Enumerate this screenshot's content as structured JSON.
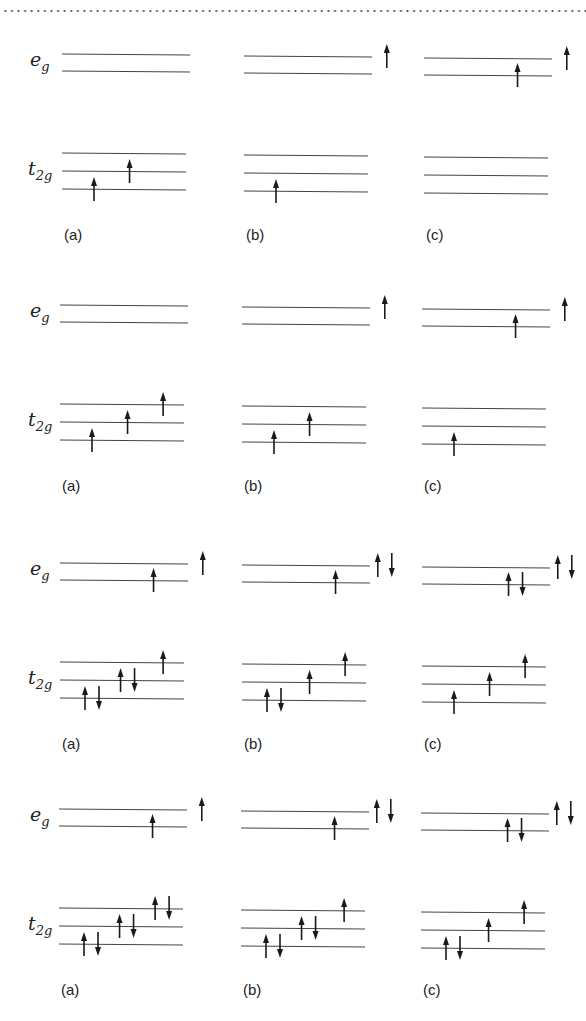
{
  "figure": {
    "row_labels": {
      "eg": "e",
      "eg_sub": "g",
      "t2g": "t",
      "t2g_sub": "2g"
    },
    "groups": [
      {
        "top": 54,
        "columns": [
          {
            "label": "(a)",
            "eg": [
              [],
              []
            ],
            "t2g": [
              [
                "up"
              ],
              [
                "up"
              ],
              []
            ]
          },
          {
            "label": "(b)",
            "eg": [
              [
                "up"
              ],
              []
            ],
            "t2g": [
              [
                "up"
              ],
              [],
              []
            ]
          },
          {
            "label": "(c)",
            "eg": [
              [
                "up"
              ],
              [
                "up"
              ]
            ],
            "t2g": [
              [],
              [],
              []
            ]
          }
        ]
      },
      {
        "top": 305,
        "columns": [
          {
            "label": "(a)",
            "eg": [
              [],
              []
            ],
            "t2g": [
              [
                "up"
              ],
              [
                "up"
              ],
              [
                "up"
              ]
            ]
          },
          {
            "label": "(b)",
            "eg": [
              [
                "up"
              ],
              []
            ],
            "t2g": [
              [
                "up"
              ],
              [
                "up"
              ],
              []
            ]
          },
          {
            "label": "(c)",
            "eg": [
              [
                "up"
              ],
              [
                "up"
              ]
            ],
            "t2g": [
              [
                "up"
              ],
              [],
              []
            ]
          }
        ]
      },
      {
        "top": 563,
        "columns": [
          {
            "label": "(a)",
            "eg": [
              [
                "up"
              ],
              [
                "up"
              ]
            ],
            "t2g": [
              [
                "up",
                "down"
              ],
              [
                "up",
                "down"
              ],
              [
                "up"
              ]
            ]
          },
          {
            "label": "(b)",
            "eg": [
              [
                "up",
                "down"
              ],
              [
                "up"
              ]
            ],
            "t2g": [
              [
                "up",
                "down"
              ],
              [
                "up"
              ],
              [
                "up"
              ]
            ]
          },
          {
            "label": "(c)",
            "eg": [
              [
                "up",
                "down"
              ],
              [
                "up",
                "down"
              ]
            ],
            "t2g": [
              [
                "up"
              ],
              [
                "up"
              ],
              [
                "up"
              ]
            ]
          }
        ]
      },
      {
        "top": 809,
        "columns": [
          {
            "label": "(a)",
            "eg": [
              [
                "up"
              ],
              [
                "up"
              ]
            ],
            "t2g": [
              [
                "up",
                "down"
              ],
              [
                "up",
                "down"
              ],
              [
                "up",
                "down"
              ]
            ]
          },
          {
            "label": "(b)",
            "eg": [
              [
                "up",
                "down"
              ],
              [
                "up"
              ]
            ],
            "t2g": [
              [
                "up",
                "down"
              ],
              [
                "up",
                "down"
              ],
              [
                "up"
              ]
            ]
          },
          {
            "label": "(c)",
            "eg": [
              [
                "up",
                "down"
              ],
              [
                "up",
                "down"
              ]
            ],
            "t2g": [
              [
                "up",
                "down"
              ],
              [
                "up"
              ],
              [
                "up"
              ]
            ]
          }
        ]
      }
    ]
  },
  "colors": {
    "line": "#444444",
    "arrow": "#1a1a1a",
    "text": "#222222"
  }
}
